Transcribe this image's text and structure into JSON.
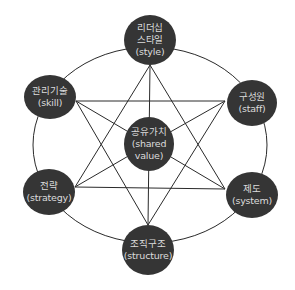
{
  "diagram": {
    "type": "7S model hexagram",
    "colors": {
      "node_fill": "#353535",
      "node_text": "#dcdcdc",
      "lines": "#2a2a2a",
      "background": "#ffffff"
    },
    "outer_ring": {
      "cx": 150,
      "cy": 145,
      "rx": 117,
      "ry": 98
    },
    "center_node": {
      "id": "shared-value",
      "lines": [
        "공유가치",
        "(shared",
        "value)"
      ],
      "cx": 149,
      "cy": 144,
      "rx": 25,
      "ry": 27
    },
    "outer_nodes": [
      {
        "id": "style",
        "lines": [
          "리더십",
          "스타일",
          "(style)"
        ],
        "cx": 150,
        "cy": 40,
        "rx": 26,
        "ry": 25,
        "vertex": [
          150,
          65
        ]
      },
      {
        "id": "skill",
        "lines": [
          "관리기술",
          "(skill)"
        ],
        "cx": 50,
        "cy": 97,
        "rx": 26,
        "ry": 22,
        "vertex": [
          76,
          101
        ]
      },
      {
        "id": "staff",
        "lines": [
          "구성원",
          "(staff)"
        ],
        "cx": 252,
        "cy": 103,
        "rx": 25,
        "ry": 23,
        "vertex": [
          225,
          101
        ]
      },
      {
        "id": "strategy",
        "lines": [
          "전략",
          "(strategy)"
        ],
        "cx": 49,
        "cy": 192,
        "rx": 26,
        "ry": 23,
        "vertex": [
          75,
          187
        ]
      },
      {
        "id": "system",
        "lines": [
          "제도",
          "(system)"
        ],
        "cx": 252,
        "cy": 195,
        "rx": 26,
        "ry": 23,
        "vertex": [
          225,
          189
        ]
      },
      {
        "id": "structure",
        "lines": [
          "조직구조",
          "(structure)"
        ],
        "cx": 148,
        "cy": 250,
        "rx": 26,
        "ry": 25,
        "vertex": [
          148,
          225
        ]
      }
    ],
    "triangles": [
      [
        "style",
        "strategy",
        "system"
      ],
      [
        "skill",
        "staff",
        "structure"
      ]
    ],
    "spokes": [
      "style",
      "skill",
      "staff",
      "strategy",
      "system",
      "structure"
    ]
  }
}
